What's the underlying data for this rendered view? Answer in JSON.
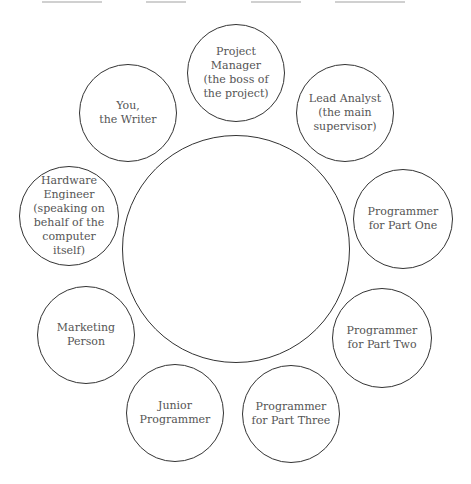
{
  "diagram": {
    "type": "hub-and-spoke",
    "center": {
      "label": "",
      "cx": 236,
      "cy": 249,
      "r": 114
    },
    "nodes": [
      {
        "id": "project-manager",
        "label": "Project\nManager\n(the boss of\nthe project)",
        "cx": 236,
        "cy": 73,
        "r": 49
      },
      {
        "id": "lead-analyst",
        "label": "Lead Analyst\n(the main\nsupervisor)",
        "cx": 345,
        "cy": 113,
        "r": 49
      },
      {
        "id": "programmer-part-one",
        "label": "Programmer\nfor Part One",
        "cx": 403,
        "cy": 219,
        "r": 50
      },
      {
        "id": "programmer-part-two",
        "label": "Programmer\nfor Part Two",
        "cx": 382,
        "cy": 338,
        "r": 50
      },
      {
        "id": "programmer-part-three",
        "label": "Programmer\nfor Part Three",
        "cx": 291,
        "cy": 414,
        "r": 49
      },
      {
        "id": "junior-programmer",
        "label": "Junior\nProgrammer",
        "cx": 175,
        "cy": 413,
        "r": 49
      },
      {
        "id": "marketing-person",
        "label": "Marketing\nPerson",
        "cx": 86,
        "cy": 335,
        "r": 49
      },
      {
        "id": "hardware-engineer",
        "label": "Hardware\nEngineer\n(speaking on\nbehalf of the\ncomputer\nitself)",
        "cx": 69,
        "cy": 216,
        "r": 50
      },
      {
        "id": "you-the-writer",
        "label": "You,\nthe Writer",
        "cx": 128,
        "cy": 113,
        "r": 49
      }
    ],
    "colors": {
      "stroke": "#333333",
      "text": "#555555",
      "background": "#ffffff"
    }
  }
}
